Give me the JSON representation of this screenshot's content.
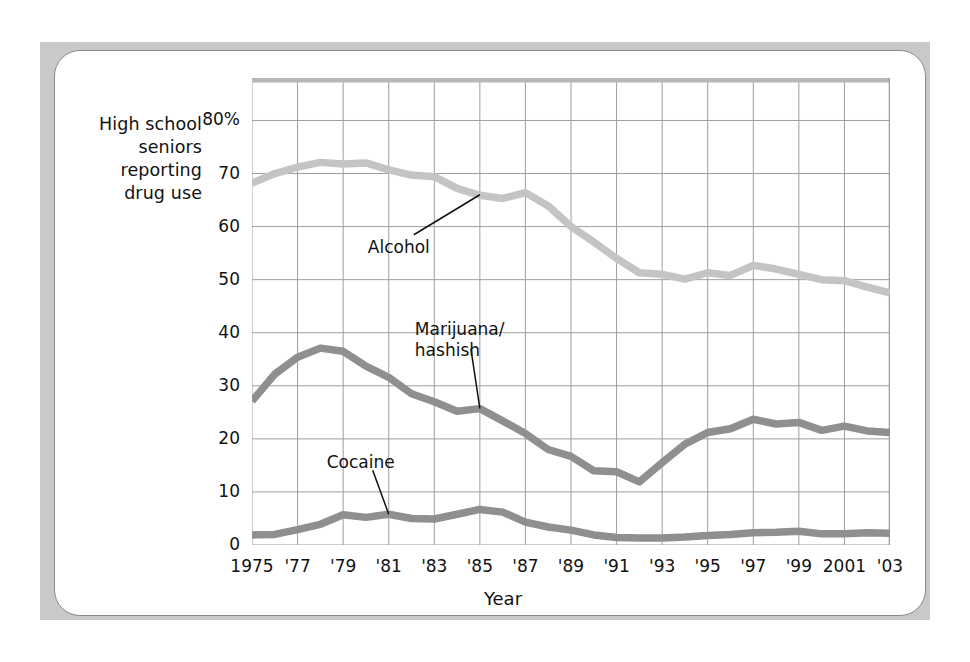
{
  "figure": {
    "y_axis_caption_lines": [
      "High school",
      "seniors",
      "reporting",
      "drug use"
    ],
    "x_axis_title": "Year"
  },
  "chart_data": {
    "type": "line",
    "title": "",
    "subtitle": "",
    "xlabel": "Year",
    "ylabel": "High school seniors reporting drug use",
    "grid": true,
    "legend_position": "inline-annotations",
    "xlim": [
      1975,
      2003
    ],
    "ylim": [
      0,
      88
    ],
    "x_tick_labels": [
      "1975",
      "'77",
      "'79",
      "'81",
      "'83",
      "'85",
      "'87",
      "'89",
      "'91",
      "'93",
      "'95",
      "'97",
      "'99",
      "2001",
      "'03"
    ],
    "x_tick_values": [
      1975,
      1977,
      1979,
      1981,
      1983,
      1985,
      1987,
      1989,
      1991,
      1993,
      1995,
      1997,
      1999,
      2001,
      2003
    ],
    "y_tick_labels": [
      "80%",
      "70",
      "60",
      "50",
      "40",
      "30",
      "20",
      "10",
      "0"
    ],
    "y_tick_values": [
      80,
      70,
      60,
      50,
      40,
      30,
      20,
      10,
      0
    ],
    "x": [
      1975,
      1976,
      1977,
      1978,
      1979,
      1980,
      1981,
      1982,
      1983,
      1984,
      1985,
      1986,
      1987,
      1988,
      1989,
      1990,
      1991,
      1992,
      1993,
      1994,
      1995,
      1996,
      1997,
      1998,
      1999,
      2000,
      2001,
      2002,
      2003
    ],
    "series": [
      {
        "name": "Alcohol",
        "color": "#c4c4c4",
        "values": [
          68.2,
          70.0,
          71.2,
          72.1,
          71.8,
          72.0,
          70.7,
          69.7,
          69.4,
          67.2,
          65.9,
          65.3,
          66.4,
          63.9,
          60.0,
          57.1,
          54.0,
          51.3,
          51.0,
          50.1,
          51.3,
          50.8,
          52.7,
          52.0,
          51.0,
          50.0,
          49.8,
          48.6,
          47.5
        ]
      },
      {
        "name": "Marijuana/hashish",
        "color": "#8f8f8f",
        "values": [
          27.1,
          32.2,
          35.4,
          37.1,
          36.5,
          33.7,
          31.6,
          28.5,
          27.0,
          25.2,
          25.7,
          23.4,
          21.0,
          18.0,
          16.7,
          14.0,
          13.8,
          11.9,
          15.5,
          19.0,
          21.2,
          21.9,
          23.7,
          22.8,
          23.1,
          21.6,
          22.4,
          21.5,
          21.2
        ]
      },
      {
        "name": "Cocaine",
        "color": "#8f8f8f",
        "values": [
          1.9,
          2.0,
          2.9,
          3.9,
          5.7,
          5.2,
          5.8,
          5.0,
          4.9,
          5.8,
          6.7,
          6.2,
          4.3,
          3.4,
          2.8,
          1.9,
          1.4,
          1.3,
          1.3,
          1.5,
          1.8,
          2.0,
          2.3,
          2.4,
          2.6,
          2.1,
          2.1,
          2.3,
          2.2
        ]
      }
    ],
    "annotations": [
      {
        "label": "Alcohol",
        "anchor_year": 1985,
        "anchor_value": 66.0
      },
      {
        "label": "Marijuana/hashish",
        "anchor_year": 1985,
        "anchor_value": 25.7
      },
      {
        "label": "Cocaine",
        "anchor_year": 1981,
        "anchor_value": 5.8
      }
    ]
  }
}
